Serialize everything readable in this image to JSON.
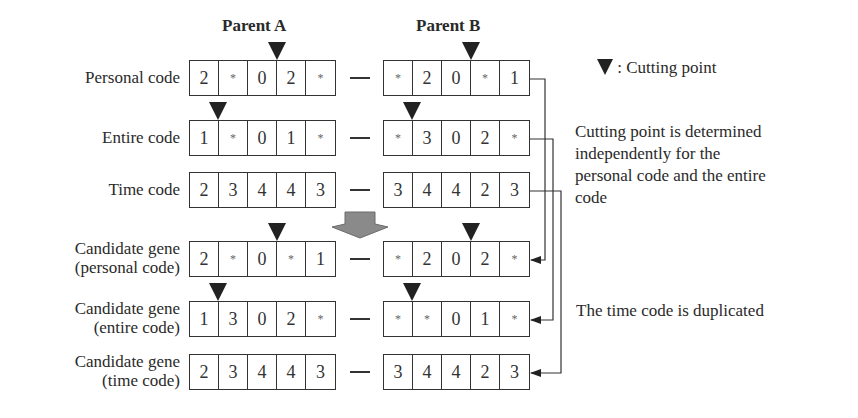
{
  "headers": {
    "parent_a": "Parent A",
    "parent_b": "Parent B"
  },
  "legend": {
    "symbol": "▼",
    "text": ": Cutting point"
  },
  "notes": {
    "cutting_point": "Cutting point is determined independently for the personal code and the entire code",
    "cutting_point_lines": [
      "Cutting point is determined",
      "independently for the",
      "personal code and the entire",
      "code"
    ],
    "time_code": "The time code is duplicated"
  },
  "separator": "—",
  "rows": [
    {
      "label_lines": [
        "Personal code"
      ],
      "a": [
        "2",
        "*",
        "0",
        "2",
        "*"
      ],
      "b": [
        "*",
        "2",
        "0",
        "*",
        "1"
      ],
      "cut_a": 3,
      "cut_b": 3
    },
    {
      "label_lines": [
        "Entire code"
      ],
      "a": [
        "1",
        "*",
        "0",
        "1",
        "*"
      ],
      "b": [
        "*",
        "3",
        "0",
        "2",
        "*"
      ],
      "cut_a": 1,
      "cut_b": 1
    },
    {
      "label_lines": [
        "Time code"
      ],
      "a": [
        "2",
        "3",
        "4",
        "4",
        "3"
      ],
      "b": [
        "3",
        "4",
        "4",
        "2",
        "3"
      ],
      "cut_a": null,
      "cut_b": null
    },
    {
      "label_lines": [
        "Candidate gene",
        "(personal code)"
      ],
      "a": [
        "2",
        "*",
        "0",
        "*",
        "1"
      ],
      "b": [
        "*",
        "2",
        "0",
        "2",
        "*"
      ],
      "cut_a": 3,
      "cut_b": 3
    },
    {
      "label_lines": [
        "Candidate gene",
        "(entire code)"
      ],
      "a": [
        "1",
        "3",
        "0",
        "2",
        "*"
      ],
      "b": [
        "*",
        "*",
        "0",
        "1",
        "*"
      ],
      "cut_a": 1,
      "cut_b": 1
    },
    {
      "label_lines": [
        "Candidate gene",
        "(time code)"
      ],
      "a": [
        "2",
        "3",
        "4",
        "4",
        "3"
      ],
      "b": [
        "3",
        "4",
        "4",
        "2",
        "3"
      ],
      "cut_a": null,
      "cut_b": null
    }
  ],
  "colors": {
    "ink": "#2a2a2a",
    "arrow_fill": "#8a8a8a",
    "triangle": "#222222"
  }
}
